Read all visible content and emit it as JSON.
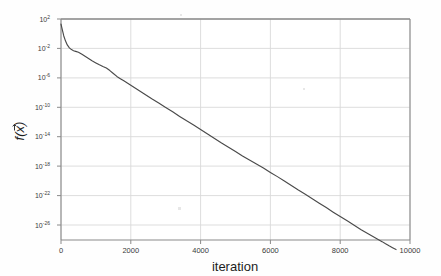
{
  "figure": {
    "background_color": "#fefefe",
    "frame_color": "#8a8a8a",
    "grid_color": "#d9d9d9",
    "line_color": "#4a4a4a"
  },
  "chart_data": {
    "type": "line",
    "title": "",
    "xlabel": "iteration",
    "ylabel": "f(x⃗)",
    "ylabel_plain": "f(x)",
    "yscale": "log",
    "xscale": "linear",
    "grid": true,
    "legend": null,
    "xlim": [
      0,
      10000
    ],
    "ylim": [
      1e-28,
      100
    ],
    "xticks": [
      0,
      2000,
      4000,
      6000,
      8000,
      10000
    ],
    "xtick_labels": [
      "0",
      "2000",
      "4000",
      "6000",
      "8000",
      "10000"
    ],
    "yticks": [
      100,
      0.01,
      1e-06,
      1e-10,
      1e-14,
      1e-18,
      1e-22,
      1e-26
    ],
    "ytick_labels": [
      "10²",
      "10⁻²",
      "10⁻⁶",
      "10⁻¹⁰",
      "10⁻¹⁴",
      "10⁻¹⁸",
      "10⁻²²",
      "10⁻²⁶"
    ],
    "ytick_mantissa": [
      "10",
      "10",
      "10",
      "10",
      "10",
      "10",
      "10",
      "10"
    ],
    "ytick_exponents": [
      "2",
      "-2",
      "-6",
      "-10",
      "-14",
      "-18",
      "-22",
      "-26"
    ],
    "series": [
      {
        "name": "objective",
        "x": [
          0,
          40,
          80,
          130,
          180,
          240,
          300,
          360,
          420,
          500,
          600,
          700,
          800,
          900,
          1000,
          1100,
          1200,
          1300,
          1400,
          1500,
          1600,
          1700,
          1800,
          1900,
          2000,
          2200,
          2400,
          2600,
          2800,
          3000,
          3200,
          3400,
          3600,
          3800,
          4000,
          4200,
          4400,
          4600,
          4800,
          5000,
          5200,
          5400,
          5600,
          5800,
          6000,
          6200,
          6400,
          6600,
          6800,
          7000,
          7200,
          7400,
          7600,
          7800,
          8000,
          8200,
          8400,
          8600,
          8800,
          9000,
          9100,
          9200,
          9300,
          9400,
          9500,
          9600
        ],
        "y": [
          20.0,
          3.0,
          0.5,
          0.1,
          0.03,
          0.012,
          0.007,
          0.005,
          0.004,
          0.003,
          0.0016,
          0.0008,
          0.0004,
          0.0002,
          0.00011,
          6e-05,
          3.5e-05,
          2.2e-05,
          1e-05,
          4e-06,
          1.6e-06,
          8e-07,
          4e-07,
          2e-07,
          1e-07,
          2.5e-08,
          6e-09,
          1.5e-09,
          4e-10,
          1e-10,
          2.5e-11,
          6e-12,
          1.5e-12,
          4e-13,
          1e-13,
          2.5e-14,
          6e-15,
          1.5e-15,
          4e-16,
          1e-16,
          2.5e-17,
          7e-18,
          2e-18,
          6e-19,
          1.5e-19,
          4e-20,
          1e-20,
          2.5e-21,
          6e-22,
          1.6e-22,
          4e-23,
          1e-23,
          2.5e-24,
          6e-25,
          1.5e-25,
          4e-26,
          1e-26,
          2.5e-27,
          7e-28,
          2e-28,
          1.1e-28,
          6e-29,
          3e-29,
          1.6e-29,
          9e-30,
          5e-30
        ]
      }
    ]
  }
}
